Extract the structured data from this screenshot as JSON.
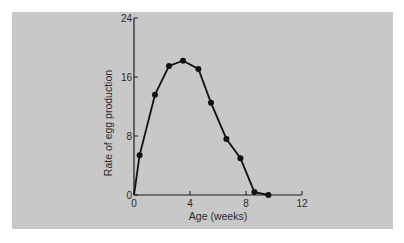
{
  "chart_data": {
    "type": "line",
    "title": "",
    "xlabel": "Age (weeks)",
    "ylabel": "Rate of egg production",
    "xlim": [
      0,
      12
    ],
    "ylim": [
      0,
      24
    ],
    "xticks": [
      0,
      4,
      8,
      12
    ],
    "yticks": [
      0,
      8,
      16,
      24
    ],
    "grid": false,
    "legend": null,
    "series": [
      {
        "name": "Egg production",
        "marker": "filled-circle",
        "color": "#111111",
        "x": [
          0.4,
          1.5,
          2.5,
          3.5,
          4.6,
          5.5,
          6.6,
          7.6,
          8.6,
          9.6
        ],
        "y": [
          5.4,
          13.6,
          17.5,
          18.2,
          17.1,
          12.5,
          7.6,
          5.0,
          0.4,
          0.0
        ]
      }
    ]
  },
  "colors": {
    "background": "#ffffff",
    "panel": "#c8c8c8",
    "ink": "#1a1a1a"
  }
}
